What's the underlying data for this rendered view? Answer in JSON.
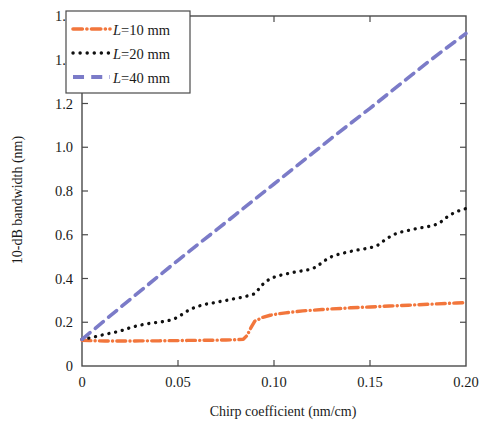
{
  "chart_data": {
    "type": "line",
    "title": "",
    "xlabel": "Chirp coefficient (nm/cm)",
    "ylabel": "10-dB bandwidth (nm)",
    "xlim": [
      0,
      0.2
    ],
    "ylim": [
      0,
      1.6
    ],
    "xticks": [
      0,
      0.05,
      0.1,
      0.15,
      0.2
    ],
    "xtick_labels": [
      "0",
      "0.05",
      "0.10",
      "0.15",
      "0.20"
    ],
    "yticks": [
      0,
      0.2,
      0.4,
      0.6,
      0.8,
      1.0,
      1.2,
      1.4,
      1.6
    ],
    "ytick_labels": [
      "0",
      "0.2",
      "0.4",
      "0.6",
      "0.8",
      "1.0",
      "1.2",
      "1.4",
      "1.6"
    ],
    "grid": false,
    "legend_position": "upper-left",
    "series": [
      {
        "name": "L=10 mm",
        "label_prefix": "L",
        "label_suffix": "=10 mm",
        "color": "#F2763C",
        "style": "dashdot",
        "x": [
          0.0,
          0.004,
          0.008,
          0.012,
          0.016,
          0.02,
          0.025,
          0.03,
          0.035,
          0.04,
          0.045,
          0.05,
          0.055,
          0.06,
          0.065,
          0.07,
          0.075,
          0.08,
          0.084,
          0.086,
          0.088,
          0.09,
          0.094,
          0.098,
          0.102,
          0.106,
          0.11,
          0.115,
          0.12,
          0.125,
          0.13,
          0.135,
          0.14,
          0.145,
          0.15,
          0.155,
          0.16,
          0.165,
          0.17,
          0.175,
          0.18,
          0.185,
          0.19,
          0.195,
          0.2
        ],
        "y": [
          0.118,
          0.116,
          0.115,
          0.114,
          0.114,
          0.114,
          0.114,
          0.115,
          0.115,
          0.115,
          0.116,
          0.116,
          0.117,
          0.117,
          0.118,
          0.118,
          0.119,
          0.12,
          0.122,
          0.14,
          0.175,
          0.205,
          0.222,
          0.232,
          0.238,
          0.243,
          0.247,
          0.252,
          0.255,
          0.258,
          0.261,
          0.263,
          0.266,
          0.268,
          0.27,
          0.272,
          0.274,
          0.276,
          0.278,
          0.28,
          0.282,
          0.284,
          0.286,
          0.288,
          0.29
        ]
      },
      {
        "name": "L=20 mm",
        "label_prefix": "L",
        "label_suffix": "=20 mm",
        "color": "#101010",
        "style": "dotted",
        "x": [
          0.0,
          0.004,
          0.008,
          0.012,
          0.016,
          0.02,
          0.024,
          0.028,
          0.032,
          0.036,
          0.04,
          0.044,
          0.048,
          0.052,
          0.056,
          0.06,
          0.064,
          0.068,
          0.07,
          0.074,
          0.078,
          0.082,
          0.086,
          0.09,
          0.094,
          0.098,
          0.102,
          0.106,
          0.11,
          0.114,
          0.118,
          0.122,
          0.126,
          0.13,
          0.134,
          0.138,
          0.142,
          0.146,
          0.15,
          0.154,
          0.158,
          0.162,
          0.166,
          0.17,
          0.174,
          0.178,
          0.182,
          0.186,
          0.19,
          0.194,
          0.198,
          0.2
        ],
        "y": [
          0.122,
          0.128,
          0.136,
          0.145,
          0.152,
          0.16,
          0.172,
          0.182,
          0.19,
          0.196,
          0.2,
          0.205,
          0.215,
          0.235,
          0.258,
          0.272,
          0.282,
          0.288,
          0.292,
          0.298,
          0.305,
          0.312,
          0.32,
          0.33,
          0.372,
          0.4,
          0.412,
          0.42,
          0.428,
          0.434,
          0.44,
          0.452,
          0.48,
          0.5,
          0.512,
          0.52,
          0.528,
          0.534,
          0.54,
          0.552,
          0.578,
          0.6,
          0.612,
          0.62,
          0.628,
          0.634,
          0.64,
          0.652,
          0.68,
          0.702,
          0.715,
          0.72
        ]
      },
      {
        "name": "L=40 mm",
        "label_prefix": "L",
        "label_suffix": "=40 mm",
        "color": "#7B7BC8",
        "style": "dashed",
        "x": [
          0.0,
          0.01,
          0.02,
          0.03,
          0.04,
          0.05,
          0.06,
          0.07,
          0.08,
          0.09,
          0.1,
          0.11,
          0.12,
          0.13,
          0.14,
          0.15,
          0.16,
          0.17,
          0.18,
          0.19,
          0.2
        ],
        "y": [
          0.122,
          0.195,
          0.268,
          0.34,
          0.412,
          0.483,
          0.553,
          0.622,
          0.692,
          0.762,
          0.832,
          0.902,
          0.972,
          1.042,
          1.11,
          1.178,
          1.248,
          1.318,
          1.388,
          1.455,
          1.52
        ]
      }
    ]
  }
}
